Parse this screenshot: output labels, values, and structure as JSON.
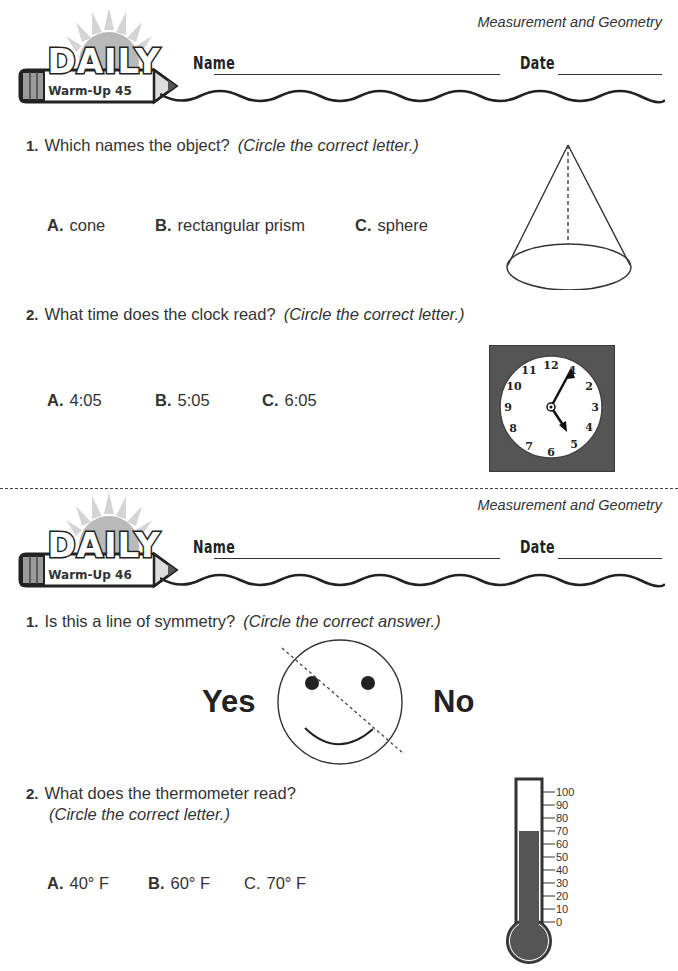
{
  "warmup_45": {
    "section_title": "Measurement and Geometry",
    "logo": {
      "title": "DAILY",
      "subtitle": "Warm-Up 45"
    },
    "name_label": "Name",
    "date_label": "Date",
    "questions": [
      {
        "number": "1.",
        "text": "Which names the object?",
        "hint": "(Circle the correct letter.)",
        "figure": "cone",
        "options": [
          {
            "letter": "A.",
            "text": "cone"
          },
          {
            "letter": "B.",
            "text": "rectangular prism"
          },
          {
            "letter": "C.",
            "text": "sphere"
          }
        ]
      },
      {
        "number": "2.",
        "text": "What time does the clock read?",
        "hint": "(Circle the correct letter.)",
        "figure": "clock",
        "clock": {
          "numerals": [
            "12",
            "1",
            "2",
            "3",
            "4",
            "5",
            "6",
            "7",
            "8",
            "9",
            "10",
            "11"
          ],
          "hour_hand_points_to": "5",
          "minute_hand_points_to": "1"
        },
        "options": [
          {
            "letter": "A.",
            "text": "4:05"
          },
          {
            "letter": "B.",
            "text": "5:05"
          },
          {
            "letter": "C.",
            "text": "6:05"
          }
        ]
      }
    ]
  },
  "warmup_46": {
    "section_title": "Measurement and Geometry",
    "logo": {
      "title": "DAILY",
      "subtitle": "Warm-Up 46"
    },
    "name_label": "Name",
    "date_label": "Date",
    "questions": [
      {
        "number": "1.",
        "text": "Is this a line of symmetry?",
        "hint": "(Circle the correct answer.)",
        "figure": "smiley-face-with-diagonal-dashed-line",
        "answers": {
          "yes": "Yes",
          "no": "No"
        }
      },
      {
        "number": "2.",
        "text": "What does the thermometer read?",
        "hint": "(Circle the correct letter.)",
        "figure": "thermometer",
        "thermometer": {
          "scale": [
            "100",
            "90",
            "80",
            "70",
            "60",
            "50",
            "40",
            "30",
            "20",
            "10",
            "0"
          ],
          "fill_level": 70
        },
        "options": [
          {
            "letter": "A.",
            "text": "40° F"
          },
          {
            "letter": "B.",
            "text": "60° F"
          },
          {
            "letter": "C.",
            "text": "70° F"
          }
        ]
      }
    ]
  }
}
